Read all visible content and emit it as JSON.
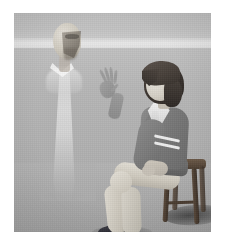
{
  "artwork": {
    "title": "Seated boy greeting a translucent apparition",
    "medium": "3D rendered illustration",
    "palette": "desaturated grayscale",
    "frame": {
      "mat_color": "#ffffff",
      "mat_thickness_px": 13,
      "canvas_width_px": 197,
      "canvas_height_px": 219
    }
  },
  "scene": {
    "environment": {
      "name": "empty gray room",
      "sky_color": "#bdbdbd",
      "horizon_color": "#e8e8e8",
      "floor_color": "#b0b0b0",
      "horizon_y_px": 25,
      "light_direction": "from upper left"
    },
    "figures": [
      {
        "id": "apparition",
        "label": "Translucent elderly figure",
        "position": "left",
        "pose": "standing, facing right in profile",
        "opacity": "semi-transparent, fading toward the floor",
        "hair": "bald",
        "garment": "long pale white robe",
        "garment_color": "#eeeeee",
        "skin_color": "#cfcabf"
      },
      {
        "id": "boy",
        "label": "Seated schoolboy",
        "position": "right",
        "pose": "seated on a stool, legs crossed at the ankles, left hand raised in greeting",
        "facing": "left, toward the apparition",
        "hair": "dark bowl cut",
        "hair_color": "#3a332e",
        "skin_color": "#d4cfc5",
        "garments": [
          {
            "item": "blazer",
            "color": "#7a7a7a",
            "detail": "two white stripes at the cuff"
          },
          {
            "item": "collar and tie",
            "color": "#e8e8e8"
          },
          {
            "item": "trousers",
            "color": "#d2cdc3"
          },
          {
            "item": "sneakers",
            "color": "#2a2a31",
            "detail": "white soles"
          }
        ]
      }
    ],
    "props": [
      {
        "id": "stool",
        "label": "Wooden stool",
        "color": "#4b3d31",
        "detail": "four legs with a cross rung"
      }
    ],
    "shadows": [
      {
        "id": "stool-shadow",
        "cast_direction": "to the right",
        "color": "#3a3a3a"
      },
      {
        "id": "feet-shadow",
        "cast_direction": "to the right",
        "color": "#6e6e6e"
      },
      {
        "id": "apparition-shadow",
        "cast_direction": "faint, directly below",
        "color": "#9a9a9a"
      }
    ]
  }
}
